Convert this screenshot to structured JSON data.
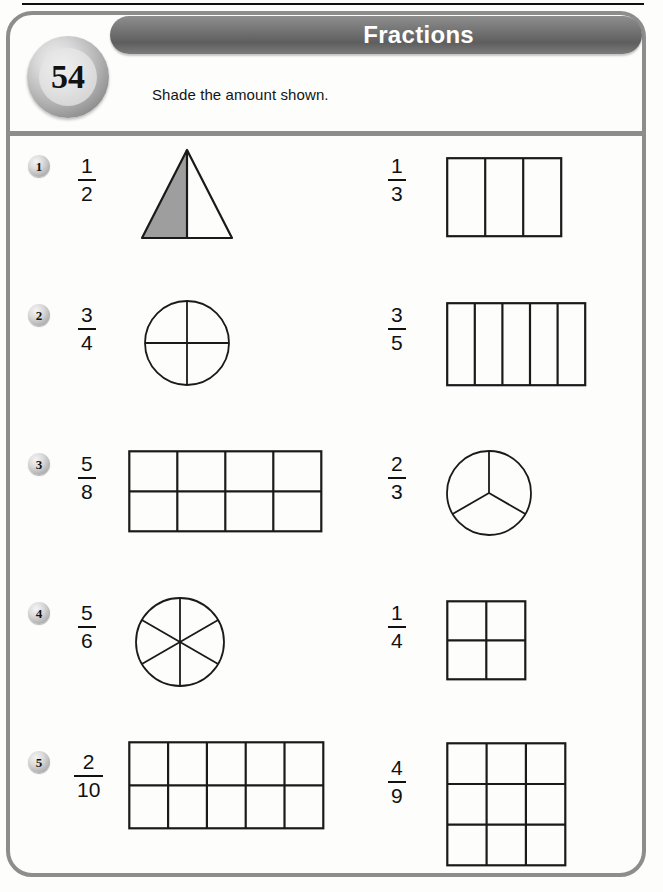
{
  "worksheet": {
    "page_number": "54",
    "title": "Fractions",
    "instruction": "Shade the amount shown.",
    "colors": {
      "title_bar": "#6f6f6f",
      "frame": "#8d8d8d",
      "shade_fill": "#9e9e9e",
      "stroke": "#1a1a1a",
      "title_text": "#ffffff"
    }
  },
  "problems": [
    {
      "number": "1",
      "left": {
        "numerator": "1",
        "denominator": "2",
        "shape": "triangle",
        "parts": 2,
        "shaded": 1
      },
      "right": {
        "numerator": "1",
        "denominator": "3",
        "shape": "rectangle-columns",
        "columns": 3,
        "rows": 1,
        "shaded": 0
      }
    },
    {
      "number": "2",
      "left": {
        "numerator": "3",
        "denominator": "4",
        "shape": "circle-quarters",
        "parts": 4,
        "shaded": 0
      },
      "right": {
        "numerator": "3",
        "denominator": "5",
        "shape": "rectangle-columns",
        "columns": 5,
        "rows": 1,
        "shaded": 0
      }
    },
    {
      "number": "3",
      "left": {
        "numerator": "5",
        "denominator": "8",
        "shape": "rectangle-grid",
        "columns": 4,
        "rows": 2,
        "shaded": 0
      },
      "right": {
        "numerator": "2",
        "denominator": "3",
        "shape": "circle-thirds",
        "parts": 3,
        "shaded": 0
      }
    },
    {
      "number": "4",
      "left": {
        "numerator": "5",
        "denominator": "6",
        "shape": "circle-sixths",
        "parts": 6,
        "shaded": 0
      },
      "right": {
        "numerator": "1",
        "denominator": "4",
        "shape": "square-grid",
        "columns": 2,
        "rows": 2,
        "shaded": 0
      }
    },
    {
      "number": "5",
      "left": {
        "numerator": "2",
        "denominator": "10",
        "shape": "rectangle-grid",
        "columns": 5,
        "rows": 2,
        "shaded": 0
      },
      "right": {
        "numerator": "4",
        "denominator": "9",
        "shape": "square-grid",
        "columns": 3,
        "rows": 3,
        "shaded": 0
      }
    }
  ]
}
